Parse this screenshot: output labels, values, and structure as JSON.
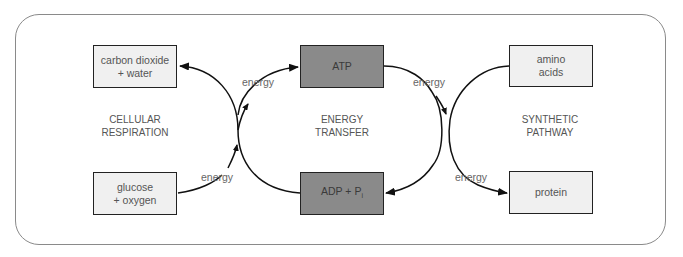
{
  "boxes": {
    "carbon_dioxide": {
      "line1": "carbon dioxide",
      "line2": "+ water"
    },
    "glucose": {
      "line1": "glucose",
      "line2": "+ oxygen"
    },
    "atp": {
      "text": "ATP"
    },
    "adp": {
      "text": "ADP + P",
      "sub": "i"
    },
    "amino": {
      "line1": "amino",
      "line2": "acids"
    },
    "protein": {
      "text": "protein"
    }
  },
  "sections": {
    "cellular": {
      "line1": "CELLULAR",
      "line2": "RESPIRATION"
    },
    "transfer": {
      "line1": "ENERGY",
      "line2": "TRANSFER"
    },
    "synthetic": {
      "line1": "SYNTHETIC",
      "line2": "PATHWAY"
    }
  },
  "energy_labels": {
    "top_left": "energy",
    "bottom_left": "energy",
    "top_right": "energy",
    "bottom_right": "energy"
  },
  "colors": {
    "light_box": "#f0f0f0",
    "dark_box": "#8a8a8a",
    "frame": "#8a8a8a"
  }
}
